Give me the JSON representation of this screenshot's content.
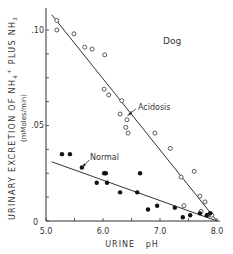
{
  "chart_data": {
    "type": "scatter",
    "title": "Dog",
    "xlabel": "URINE pH",
    "ylabel": "URINARY EXCRETION OF NH4+ PLUS NH3",
    "ylabel_units": "(mMoles/min)",
    "xlim": [
      5.0,
      8.0
    ],
    "ylim": [
      0,
      0.11
    ],
    "x_ticks": [
      "5.0",
      "6.0",
      "7.0",
      "8.0"
    ],
    "y_ticks": [
      "0",
      ".05",
      ".10"
    ],
    "grid": false,
    "annotations": [
      "Dog",
      "Acidosis",
      "Normal"
    ],
    "series": [
      {
        "name": "Acidosis",
        "marker": "open-circle",
        "points": [
          [
            5.19,
            0.105
          ],
          [
            5.19,
            0.1
          ],
          [
            5.49,
            0.098
          ],
          [
            5.68,
            0.091
          ],
          [
            5.81,
            0.09
          ],
          [
            6.03,
            0.087
          ],
          [
            6.02,
            0.069
          ],
          [
            6.1,
            0.066
          ],
          [
            6.33,
            0.063
          ],
          [
            6.3,
            0.056
          ],
          [
            6.42,
            0.053
          ],
          [
            6.4,
            0.049
          ],
          [
            6.44,
            0.046
          ],
          [
            6.91,
            0.046
          ],
          [
            7.18,
            0.038
          ],
          [
            7.37,
            0.023
          ],
          [
            7.6,
            0.026
          ],
          [
            7.42,
            0.008
          ],
          [
            7.7,
            0.013
          ],
          [
            7.79,
            0.01
          ],
          [
            7.72,
            0.005
          ],
          [
            7.88,
            0.004
          ],
          [
            7.84,
            0.003
          ],
          [
            7.91,
            0.003
          ]
        ],
        "fit_line": [
          [
            5.1,
            0.108
          ],
          [
            8.0,
            0.0
          ]
        ]
      },
      {
        "name": "Normal",
        "marker": "filled-circle",
        "points": [
          [
            5.28,
            0.035
          ],
          [
            5.42,
            0.035
          ],
          [
            5.63,
            0.028
          ],
          [
            5.89,
            0.02
          ],
          [
            6.02,
            0.025
          ],
          [
            6.05,
            0.025
          ],
          [
            6.07,
            0.02
          ],
          [
            6.3,
            0.015
          ],
          [
            6.65,
            0.025
          ],
          [
            6.6,
            0.015
          ],
          [
            6.79,
            0.006
          ],
          [
            6.95,
            0.008
          ],
          [
            7.26,
            0.007
          ],
          [
            7.4,
            0.002
          ],
          [
            7.53,
            0.003
          ],
          [
            7.7,
            0.004
          ],
          [
            7.82,
            0.003
          ],
          [
            7.88,
            0.004
          ]
        ],
        "fit_line": [
          [
            5.1,
            0.031
          ],
          [
            8.0,
            0.0
          ]
        ]
      }
    ]
  },
  "labels": {
    "species": "Dog",
    "acidosis": "Acidosis",
    "normal": "Normal",
    "xlabel": "URINE   pH",
    "ylabel_line1": "URINARY EXCRETION OF NH",
    "ylabel_sub1": "4",
    "ylabel_sup1": "+",
    "ylabel_mid": " PLUS  NH",
    "ylabel_sub2": "3",
    "ylabel_units": "(mMoles/min)",
    "x_tick_0": "5.0",
    "x_tick_1": "6.0",
    "x_tick_2": "7.0",
    "x_tick_3": "8.0",
    "y_tick_0": "0",
    "y_tick_1": ".05",
    "y_tick_2": ".10"
  },
  "colors": {
    "ink": "#333333",
    "background": "#ffffff"
  }
}
